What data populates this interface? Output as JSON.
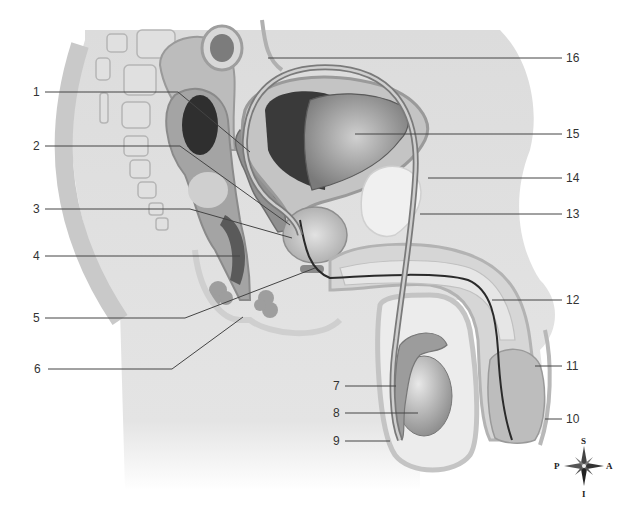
{
  "figure": {
    "labels": [
      {
        "id": "1",
        "text": "1"
      },
      {
        "id": "2",
        "text": "2"
      },
      {
        "id": "3",
        "text": "3"
      },
      {
        "id": "4",
        "text": "4"
      },
      {
        "id": "5",
        "text": "5"
      },
      {
        "id": "6",
        "text": "6"
      },
      {
        "id": "7",
        "text": "7"
      },
      {
        "id": "8",
        "text": "8"
      },
      {
        "id": "9",
        "text": "9"
      },
      {
        "id": "10",
        "text": "10"
      },
      {
        "id": "11",
        "text": "11"
      },
      {
        "id": "12",
        "text": "12"
      },
      {
        "id": "13",
        "text": "13"
      },
      {
        "id": "14",
        "text": "14"
      },
      {
        "id": "15",
        "text": "15"
      },
      {
        "id": "16",
        "text": "16"
      }
    ],
    "compass": {
      "superior": "S",
      "inferior": "I",
      "posterior": "P",
      "anterior": "A"
    },
    "colors": {
      "tissue_light": "#e6e6e6",
      "tissue_mid": "#bdbdbd",
      "tissue_dark": "#6e6e6e",
      "outline": "#9a9a9a",
      "leader": "#444444"
    }
  }
}
